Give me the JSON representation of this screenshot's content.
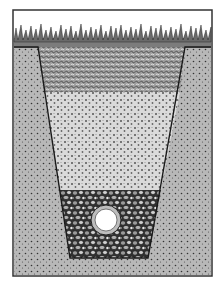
{
  "illustration": {
    "subject": "french-drain-cross-section",
    "layers": [
      {
        "name": "grass",
        "color": "#8a8a8a"
      },
      {
        "name": "coarse-fill",
        "color": "#a8a8a8"
      },
      {
        "name": "fine-gravel",
        "color": "#d8d8d8"
      },
      {
        "name": "drain-rock",
        "color": "#9a9a9a"
      },
      {
        "name": "native-soil",
        "color": "#b4b4b4"
      }
    ],
    "pipe": {
      "cx": 106,
      "cy": 220,
      "outer_r": 15,
      "inner_r": 11
    },
    "colors": {
      "frame": "#333333",
      "outline": "#1a1a1a",
      "background": "#ffffff"
    }
  }
}
